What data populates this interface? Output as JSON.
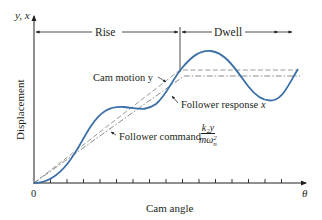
{
  "diagram": {
    "axes": {
      "y_axis_symbol": "y, x",
      "y_axis_label": "Displacement",
      "x_axis_label": "Cam angle",
      "x_axis_symbol": "θ",
      "origin_label": "0",
      "tick_count": 16
    },
    "regions": {
      "rise": "Rise",
      "dwell": "Dwell"
    },
    "curves": {
      "cam_motion": {
        "label": "Cam motion y",
        "style": "dashed",
        "color": "#9a9a9a"
      },
      "follower_response": {
        "label": "Follower response",
        "symbol": "x",
        "style": "solid",
        "color": "#3a6fa8"
      },
      "follower_command": {
        "label": "Follower command",
        "numerator": "k₂y",
        "denominator": "mω",
        "denominator_sup": "2",
        "denominator_sub": "n",
        "style": "dash-dot",
        "color": "#8a8a8a"
      }
    }
  }
}
